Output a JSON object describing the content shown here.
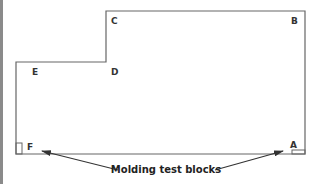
{
  "diagram": {
    "corner_labels": {
      "A": "A",
      "B": "B",
      "C": "C",
      "D": "D",
      "E": "E",
      "F": "F"
    },
    "caption": "Molding test blocks",
    "colors": {
      "outline": "#666666",
      "text": "#222222",
      "arrow": "#333333",
      "left_border": "#8a8a8a"
    }
  }
}
